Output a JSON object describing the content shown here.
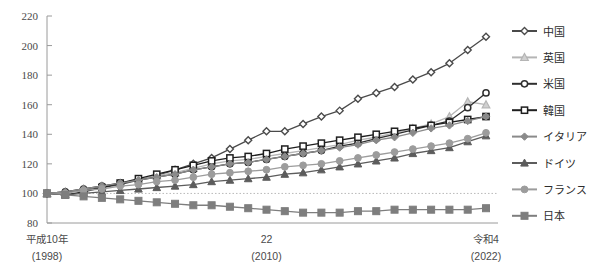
{
  "chart_data": {
    "type": "line",
    "title": "",
    "subtitle": "",
    "xlabel": "",
    "ylabel": "",
    "ylim": [
      80,
      220
    ],
    "y_ticks": [
      80,
      100,
      120,
      140,
      160,
      180,
      200,
      220
    ],
    "grid": false,
    "reference_line": {
      "value": 100,
      "style": "dotted"
    },
    "legend_position": "right",
    "x": [
      1998,
      1999,
      2000,
      2001,
      2002,
      2003,
      2004,
      2005,
      2006,
      2007,
      2008,
      2009,
      2010,
      2011,
      2012,
      2013,
      2014,
      2015,
      2016,
      2017,
      2018,
      2019,
      2020,
      2021,
      2022
    ],
    "x_tick_labels": [
      {
        "at": 1998,
        "era": "平成10年",
        "western": "(1998)"
      },
      {
        "at": 2010,
        "era": "22",
        "western": "(2010)"
      },
      {
        "at": 2022,
        "era": "令和4",
        "western": "(2022)"
      }
    ],
    "series": [
      {
        "name": "中国",
        "color": "#4a4a4a",
        "marker": "diamond-open",
        "values": [
          100,
          101,
          102,
          104,
          106,
          109,
          112,
          116,
          120,
          124,
          130,
          136,
          142,
          142,
          147,
          152,
          156,
          164,
          168,
          172,
          177,
          182,
          188,
          197,
          206
        ]
      },
      {
        "name": "英国",
        "color": "#b5b5b5",
        "marker": "triangle-light",
        "values": [
          100,
          101,
          103,
          105,
          107,
          109,
          112,
          114,
          117,
          120,
          122,
          123,
          125,
          127,
          129,
          131,
          133,
          136,
          138,
          141,
          144,
          147,
          152,
          162,
          160
        ]
      },
      {
        "name": "米国",
        "color": "#2f2f2f",
        "marker": "circle-open",
        "values": [
          100,
          101,
          103,
          105,
          107,
          109,
          111,
          113,
          116,
          118,
          120,
          121,
          123,
          125,
          127,
          129,
          132,
          134,
          137,
          140,
          143,
          146,
          149,
          158,
          168
        ]
      },
      {
        "name": "韓国",
        "color": "#1f1f1f",
        "marker": "square-open",
        "values": [
          100,
          99,
          101,
          104,
          107,
          110,
          113,
          116,
          119,
          122,
          124,
          125,
          127,
          130,
          132,
          134,
          136,
          138,
          140,
          142,
          144,
          146,
          148,
          150,
          152
        ]
      },
      {
        "name": "イタリア",
        "color": "#8a8a8a",
        "marker": "diamond-filled",
        "values": [
          100,
          101,
          103,
          105,
          107,
          109,
          111,
          113,
          116,
          118,
          120,
          121,
          123,
          125,
          127,
          129,
          131,
          133,
          136,
          138,
          141,
          144,
          146,
          149,
          152
        ]
      },
      {
        "name": "ドイツ",
        "color": "#5c5c5c",
        "marker": "triangle-filled",
        "values": [
          100,
          99,
          100,
          101,
          102,
          103,
          104,
          105,
          106,
          108,
          109,
          110,
          111,
          113,
          114,
          116,
          118,
          120,
          122,
          124,
          127,
          129,
          131,
          135,
          139
        ]
      },
      {
        "name": "フランス",
        "color": "#9c9c9c",
        "marker": "circle-filled",
        "values": [
          100,
          100,
          102,
          103,
          105,
          106,
          108,
          109,
          111,
          113,
          114,
          115,
          116,
          118,
          119,
          120,
          122,
          124,
          126,
          128,
          130,
          132,
          134,
          137,
          141
        ]
      },
      {
        "name": "日本",
        "color": "#7e7e7e",
        "marker": "square-filled",
        "values": [
          100,
          99,
          98,
          97,
          96,
          95,
          94,
          93,
          92,
          92,
          91,
          90,
          89,
          88,
          87,
          87,
          87,
          88,
          88,
          89,
          89,
          89,
          89,
          89,
          90
        ]
      }
    ]
  },
  "legend": {
    "items": [
      {
        "label": "中国"
      },
      {
        "label": "英国"
      },
      {
        "label": "米国"
      },
      {
        "label": "韓国"
      },
      {
        "label": "イタリア"
      },
      {
        "label": "ドイツ"
      },
      {
        "label": "フランス"
      },
      {
        "label": "日本"
      }
    ]
  }
}
